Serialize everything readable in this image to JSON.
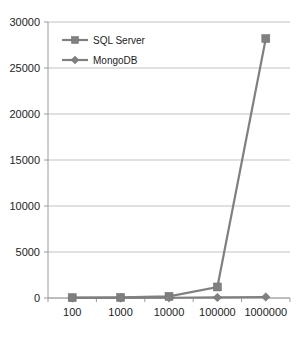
{
  "chart_data": {
    "type": "line",
    "title": "",
    "subtitle": "",
    "xlabel": "",
    "ylabel": "",
    "categories": [
      "100",
      "1000",
      "10000",
      "100000",
      "1000000"
    ],
    "series": [
      {
        "name": "SQL Server",
        "marker": "square",
        "color": "#808080",
        "values": [
          30,
          60,
          180,
          1200,
          28200
        ]
      },
      {
        "name": "MongoDB",
        "marker": "diamond",
        "color": "#808080",
        "values": [
          10,
          15,
          25,
          60,
          110
        ]
      }
    ],
    "ylim": [
      0,
      30000
    ],
    "ytick_values": [
      0,
      5000,
      10000,
      15000,
      20000,
      25000,
      30000
    ],
    "ytick_labels": [
      "0",
      "5000",
      "10000",
      "15000",
      "20000",
      "25000",
      "30000"
    ],
    "grid": true,
    "legend_position": "top-left-inside",
    "background": "#ffffff",
    "gridline_color": "#b3b3b3",
    "axis_color": "#9a9a9a",
    "text_color": "#1d1d1d"
  },
  "legend": {
    "entries": [
      {
        "label": "SQL Server"
      },
      {
        "label": "MongoDB"
      }
    ]
  }
}
